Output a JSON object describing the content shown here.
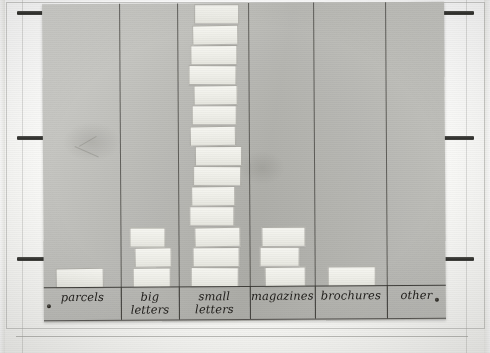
{
  "scene": {
    "kind": "photograph-of-paper-bar-chart",
    "surface_label": "poster-paper",
    "tack_count": 2
  },
  "chart_data": {
    "type": "bar",
    "title": "",
    "subtitle": "",
    "xlabel": "",
    "ylabel": "",
    "unit": "stickers",
    "grid": false,
    "legend": null,
    "note": "Hand-made pictogram: each bar is a stack of small white paper squares stuck onto a grey poster. Bar height = number of squares.",
    "categories": [
      "parcels",
      "big letters",
      "small letters",
      "magazines",
      "brochures",
      "other"
    ],
    "values": [
      1,
      3,
      14,
      3,
      1,
      0
    ],
    "ylim": [
      0,
      14
    ],
    "max_value": 14,
    "bars": [
      {
        "category": "parcels",
        "label_lines": [
          "parcels"
        ],
        "count": 1
      },
      {
        "category": "big letters",
        "label_lines": [
          "big",
          "letters"
        ],
        "count": 3
      },
      {
        "category": "small letters",
        "label_lines": [
          "small",
          "letters"
        ],
        "count": 14
      },
      {
        "category": "magazines",
        "label_lines": [
          "magazines"
        ],
        "count": 3
      },
      {
        "category": "brochures",
        "label_lines": [
          "brochures"
        ],
        "count": 1
      },
      {
        "category": "other",
        "label_lines": [
          "other"
        ],
        "count": 0
      }
    ]
  },
  "colors": {
    "poster": "#bdbdb8",
    "sticker": "#f1f1ec",
    "ink": "#23211e",
    "rail": "#2e2e2b",
    "backdrop": "#fbfbf9"
  }
}
